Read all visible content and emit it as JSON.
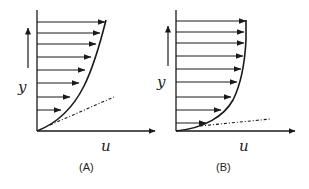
{
  "figure": {
    "panels": [
      {
        "id": "A",
        "caption": "(A)",
        "x_axis_label": "u",
        "y_axis_label": "y",
        "profile_shape": "parabolic-like (finite wall slope)",
        "arrow_count": 8,
        "tangent_line": "dash-dot, steeper"
      },
      {
        "id": "B",
        "caption": "(B)",
        "x_axis_label": "u",
        "y_axis_label": "y",
        "profile_shape": "full/turbulent-like (shallow wall slope)",
        "arrow_count": 9,
        "tangent_line": "dash-dot, shallow"
      }
    ],
    "colors": {
      "ink": "#1a1a1a",
      "background": "#ffffff"
    }
  }
}
